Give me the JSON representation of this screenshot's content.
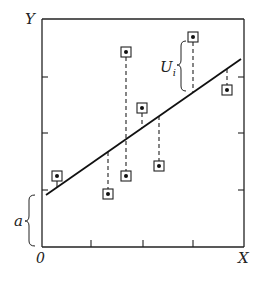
{
  "diagram": {
    "type": "regression-residuals",
    "labels": {
      "y_axis": "Y",
      "x_axis": "X",
      "origin": "0",
      "intercept": "a",
      "residual": "U",
      "residual_subscript": "i"
    },
    "colors": {
      "ink": "#222222",
      "background": "#ffffff"
    },
    "axes_box": {
      "left": 42,
      "top": 19,
      "right": 244,
      "bottom": 247
    },
    "x_ticks": [
      91,
      143,
      193
    ],
    "y_ticks_left": [
      77,
      133,
      190
    ],
    "y_ticks_right": [
      77,
      133,
      190
    ],
    "regression_line": {
      "x1": 46,
      "y1": 195,
      "x2": 241,
      "y2": 59
    },
    "points": [
      {
        "x": 57,
        "y": 176,
        "line_y": 187
      },
      {
        "x": 108,
        "y": 194,
        "line_y": 152
      },
      {
        "x": 126,
        "y": 52,
        "line_y": 139
      },
      {
        "x": 126,
        "y": 176,
        "line_y": 139
      },
      {
        "x": 142,
        "y": 108,
        "line_y": 128
      },
      {
        "x": 159,
        "y": 166,
        "line_y": 116
      },
      {
        "x": 193,
        "y": 37,
        "line_y": 93
      },
      {
        "x": 227,
        "y": 90,
        "line_y": 69
      }
    ]
  }
}
